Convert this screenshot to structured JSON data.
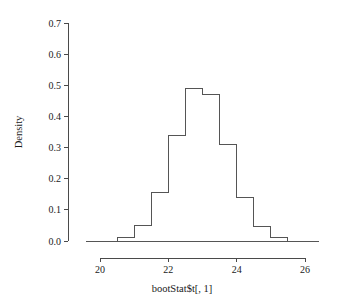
{
  "chart_data": {
    "type": "bar",
    "title": "",
    "subtitle": "",
    "xlabel": "bootStat$t[, 1]",
    "ylabel": "Density",
    "xlim": [
      19.6,
      26.4
    ],
    "ylim": [
      0.0,
      0.7
    ],
    "grid": false,
    "legend": null,
    "bin_width": 0.5,
    "bin_edges": [
      20.0,
      20.5,
      21.0,
      21.5,
      22.0,
      22.5,
      23.0,
      23.5,
      24.0,
      24.5,
      25.0,
      25.5
    ],
    "categories": [
      "20.0-20.5",
      "20.5-21.0",
      "21.0-21.5",
      "21.5-22.0",
      "22.0-22.5",
      "22.5-23.0",
      "23.0-23.5",
      "23.5-24.0",
      "24.0-24.5",
      "24.5-25.0",
      "25.0-25.5"
    ],
    "values": [
      0.0,
      0.01,
      0.05,
      0.155,
      0.34,
      0.49,
      0.47,
      0.31,
      0.14,
      0.045,
      0.01
    ],
    "x_ticks": [
      20,
      22,
      24,
      26
    ],
    "x_tick_labels": [
      "20",
      "22",
      "24",
      "26"
    ],
    "y_ticks": [
      0.0,
      0.1,
      0.2,
      0.3,
      0.4,
      0.5,
      0.6,
      0.7
    ],
    "y_tick_labels": [
      "0.0",
      "0.1",
      "0.2",
      "0.3",
      "0.4",
      "0.5",
      "0.6",
      "0.7"
    ],
    "colors": {
      "bar_stroke": "#555555",
      "bar_fill": "none",
      "axis": "#4a4a4a",
      "text": "#1a1a1a",
      "background": "#ffffff"
    }
  }
}
